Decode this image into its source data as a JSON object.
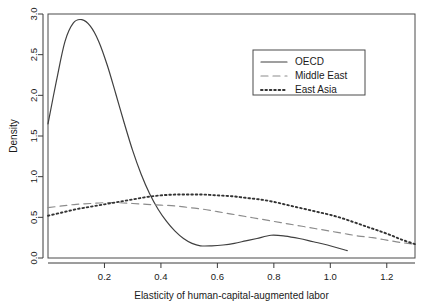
{
  "chart_data": {
    "type": "line",
    "title": "",
    "subtitle": "",
    "xlabel": "Elasticity of human-capital-augmented labor",
    "ylabel": "Density",
    "xlim": [
      0.0,
      1.3
    ],
    "ylim": [
      0.0,
      3.0
    ],
    "xticks": [
      0.2,
      0.4,
      0.6,
      0.8,
      1.0,
      1.2
    ],
    "xtick_labels": [
      "0.2",
      "0.4",
      "0.6",
      "0.8",
      "1.0",
      "1.2"
    ],
    "yticks": [
      0.0,
      0.5,
      1.0,
      1.5,
      2.0,
      2.5,
      3.0
    ],
    "ytick_labels": [
      "0.0",
      "0.5",
      "1.0",
      "1.5",
      "2.0",
      "2.5",
      "3.0"
    ],
    "grid": false,
    "legend_position": "top-right",
    "series": [
      {
        "name": "OECD",
        "style": "solid",
        "color": "#404040",
        "x": [
          0.0,
          0.03,
          0.06,
          0.09,
          0.12,
          0.15,
          0.18,
          0.21,
          0.24,
          0.27,
          0.3,
          0.33,
          0.36,
          0.39,
          0.42,
          0.45,
          0.48,
          0.51,
          0.54,
          0.58,
          0.62,
          0.66,
          0.7,
          0.74,
          0.79,
          0.84,
          0.89,
          0.94,
          0.99,
          1.06
        ],
        "y": [
          1.65,
          2.18,
          2.66,
          2.89,
          2.93,
          2.85,
          2.66,
          2.37,
          2.02,
          1.66,
          1.32,
          1.03,
          0.79,
          0.6,
          0.45,
          0.33,
          0.24,
          0.18,
          0.15,
          0.15,
          0.16,
          0.18,
          0.21,
          0.24,
          0.28,
          0.27,
          0.24,
          0.2,
          0.16,
          0.09
        ]
      },
      {
        "name": "Middle East",
        "style": "dashed",
        "color": "#8c8c8c",
        "x": [
          0.0,
          0.05,
          0.1,
          0.15,
          0.2,
          0.25,
          0.3,
          0.35,
          0.4,
          0.45,
          0.5,
          0.55,
          0.6,
          0.65,
          0.7,
          0.75,
          0.8,
          0.85,
          0.9,
          0.95,
          1.0,
          1.05,
          1.1,
          1.15,
          1.2,
          1.25,
          1.3
        ],
        "y": [
          0.62,
          0.64,
          0.66,
          0.67,
          0.68,
          0.68,
          0.67,
          0.66,
          0.65,
          0.64,
          0.62,
          0.6,
          0.57,
          0.54,
          0.51,
          0.48,
          0.45,
          0.42,
          0.39,
          0.36,
          0.33,
          0.3,
          0.27,
          0.25,
          0.22,
          0.19,
          0.17
        ]
      },
      {
        "name": "East Asia",
        "style": "dotted",
        "color": "#333333",
        "x": [
          0.0,
          0.05,
          0.1,
          0.15,
          0.2,
          0.25,
          0.3,
          0.35,
          0.4,
          0.45,
          0.5,
          0.55,
          0.6,
          0.65,
          0.7,
          0.75,
          0.8,
          0.85,
          0.9,
          0.95,
          1.0,
          1.05,
          1.1,
          1.15,
          1.2,
          1.25,
          1.3
        ],
        "y": [
          0.52,
          0.56,
          0.6,
          0.63,
          0.66,
          0.69,
          0.72,
          0.75,
          0.77,
          0.78,
          0.78,
          0.78,
          0.77,
          0.76,
          0.74,
          0.72,
          0.69,
          0.65,
          0.61,
          0.57,
          0.53,
          0.48,
          0.42,
          0.36,
          0.3,
          0.23,
          0.17
        ]
      }
    ]
  },
  "legend": {
    "entries": [
      {
        "label": "OECD"
      },
      {
        "label": "Middle East"
      },
      {
        "label": "East Asia"
      }
    ]
  },
  "axes": {
    "x_title": "Elasticity of human-capital-augmented labor",
    "y_title": "Density"
  }
}
